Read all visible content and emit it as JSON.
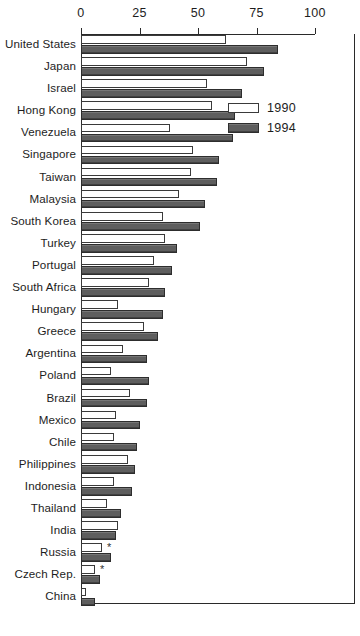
{
  "chart_data": {
    "type": "bar",
    "orientation": "horizontal",
    "title": "",
    "xlabel": "",
    "ylabel": "",
    "xlim": [
      0,
      117
    ],
    "xticks": [
      0,
      25,
      50,
      75,
      100
    ],
    "xtick_labels": [
      "0",
      "25",
      "50",
      "75",
      "100"
    ],
    "grid": false,
    "legend_position": "upper-right-inside",
    "categories": [
      "United States",
      "Japan",
      "Israel",
      "Hong Kong",
      "Venezuela",
      "Singapore",
      "Taiwan",
      "Malaysia",
      "South Korea",
      "Turkey",
      "Portugal",
      "South Africa",
      "Hungary",
      "Greece",
      "Argentina",
      "Poland",
      "Brazil",
      "Mexico",
      "Chile",
      "Philippines",
      "Indonesia",
      "Thailand",
      "India",
      "Russia",
      "Czech Rep.",
      "China"
    ],
    "series": [
      {
        "name": "1990",
        "color": "#ffffff",
        "values": [
          62,
          71,
          54,
          56,
          38,
          48,
          47,
          42,
          35,
          36,
          31,
          29,
          16,
          27,
          18,
          13,
          21,
          15,
          14,
          20,
          14,
          11,
          16,
          9,
          6,
          2
        ]
      },
      {
        "name": "1994",
        "color": "#5e5e5e",
        "values": [
          84,
          78,
          69,
          66,
          65,
          59,
          58,
          53,
          51,
          41,
          39,
          36,
          35,
          33,
          28,
          29,
          28,
          25,
          24,
          23,
          22,
          17,
          15,
          13,
          8,
          6
        ]
      }
    ],
    "annotations": [
      {
        "category": "Russia",
        "series": "1990",
        "marker": "*"
      },
      {
        "category": "Czech Rep.",
        "series": "1990",
        "marker": "*"
      }
    ],
    "legend": [
      {
        "label": "1990",
        "swatch": "white"
      },
      {
        "label": "1994",
        "swatch": "dark-gray"
      }
    ]
  }
}
